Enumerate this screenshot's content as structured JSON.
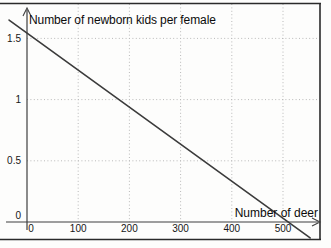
{
  "figure": {
    "background": "#fdfdfc",
    "kind": "scanned textbook line chart"
  },
  "chart_data": {
    "type": "line",
    "title": "Number of newborn kids per female",
    "xlabel": "Number of deer",
    "ylabel": "",
    "x_ticks": [
      0,
      100,
      200,
      300,
      400,
      500
    ],
    "y_ticks": [
      0,
      0.5,
      1,
      1.5
    ],
    "xlim": [
      -40,
      570
    ],
    "ylim": [
      -0.15,
      1.8
    ],
    "grid": true,
    "grid_style": "dotted",
    "legend": "none",
    "series": [
      {
        "name": "newborn kids per female vs number of deer",
        "points": [
          {
            "x": -35,
            "y": 1.65
          },
          {
            "x": 553,
            "y": -0.13
          }
        ],
        "y_intercept": 1.53,
        "x_intercept": 508,
        "relation": "linear decline: y ≈ 1.5 − 0.003·x",
        "color": "#3b3b3b"
      }
    ],
    "colors": {
      "axis": "#3f3f3f",
      "grid": "#b9b9b9",
      "frame": "#2a2a2a",
      "line": "#3b3b3b",
      "text": "#161616"
    },
    "layout": {
      "px": {
        "x0": 27,
        "per_x": 0.512,
        "y0": 222,
        "per_y": 122.4,
        "grid_top": 4,
        "grid_bottom": 222,
        "grid_left": 27,
        "grid_right": 319,
        "xaxis_start": 6,
        "xaxis_end": 318,
        "yaxis_top": 10,
        "yaxis_bottom": 230,
        "frame_top": 3.5,
        "frame_right": 320,
        "frame_bottom": 239.5,
        "frame_hmax": 321,
        "ytick_right_edge": 21,
        "xtick_baseline_offset": 10,
        "zero_xtick_shift": 4,
        "zero_ytick_shift": -7
      }
    }
  }
}
